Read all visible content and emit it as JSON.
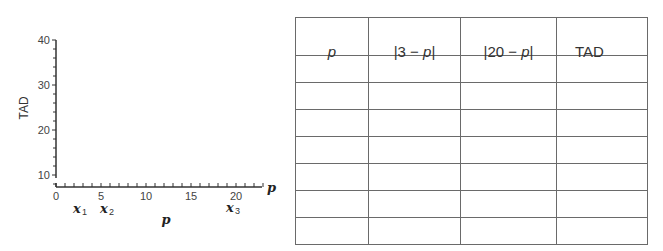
{
  "chart_data": {
    "type": "line",
    "title": "",
    "xlabel": "p",
    "ylabel": "TAD",
    "x_axis_end_label": "p",
    "xlim": [
      0,
      23
    ],
    "ylim": [
      8,
      40
    ],
    "x_ticks": [
      0,
      5,
      10,
      15,
      20
    ],
    "x_tick_labels": [
      "0",
      "5",
      "10",
      "15",
      "20"
    ],
    "x_minor_tick_step": 1,
    "y_ticks": [
      10,
      20,
      30,
      40
    ],
    "y_tick_labels": [
      "10",
      "20",
      "30",
      "40"
    ],
    "y_minor_tick_step": 2,
    "grid": false,
    "series": [],
    "annotations": [
      {
        "text": "x",
        "subscript": "1",
        "x": 3
      },
      {
        "text": "x",
        "subscript": "2",
        "x": 6
      },
      {
        "text": "x",
        "subscript": "3",
        "x": 20
      }
    ],
    "note": "Blank axes for plotting TAD against p"
  },
  "table": {
    "headers": [
      "p",
      "|3 − p|",
      "|20 − p|",
      "TAD"
    ],
    "header_parts": {
      "col1_prefix": "|3 − ",
      "col1_var": "p",
      "col1_suffix": "|",
      "col2_prefix": "|20 − ",
      "col2_var": "p",
      "col2_suffix": "|"
    },
    "rows": [
      [
        "",
        "",
        "",
        ""
      ],
      [
        "",
        "",
        "",
        ""
      ],
      [
        "",
        "",
        "",
        ""
      ],
      [
        "",
        "",
        "",
        ""
      ],
      [
        "",
        "",
        "",
        ""
      ],
      [
        "",
        "",
        "",
        ""
      ],
      [
        "",
        "",
        "",
        ""
      ]
    ]
  }
}
